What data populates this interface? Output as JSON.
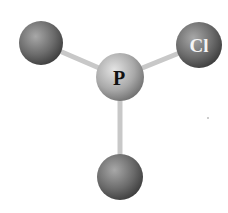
{
  "diagram": {
    "type": "ball-and-stick molecule",
    "central_atom": {
      "label": "P",
      "x": 120,
      "y": 77,
      "r": 24
    },
    "outer_atoms": [
      {
        "label": "",
        "x": 41,
        "y": 43,
        "r": 22
      },
      {
        "label": "Cl",
        "x": 199,
        "y": 45,
        "r": 23
      },
      {
        "label": "",
        "x": 120,
        "y": 177,
        "r": 23
      }
    ],
    "colors": {
      "central_light": "#d8d8d8",
      "central_dark": "#6e6e6e",
      "outer_light": "#a8a8a8",
      "outer_dark": "#3c3c3c",
      "bond": "#cfcfcf",
      "label_central": "#111111",
      "label_outer": "#f4f4f4"
    }
  }
}
